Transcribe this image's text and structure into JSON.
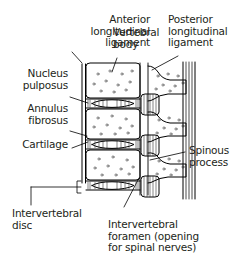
{
  "figure": {
    "background_color": "#ffffff",
    "ink_color": "#231f20",
    "line_color": "#000000"
  },
  "labels": {
    "anterior_longitudinal_ligament": "Anterior\nlongitudinal\nligament",
    "vertebral_body": "Vertebral\nbody",
    "posterior_longitudinal_ligament": "Posterior\nlongitudinal\nligament",
    "nucleus_pulposus": "Nucleus\npulposus",
    "annulus_fibrosus": "Annulus\nfibrosus",
    "cartilage": "Cartilage",
    "spinous_process": "Spinous\nprocess",
    "intervertebral_disc": "Intervertebral\ndisc",
    "intervertebral_foramen": "Intervertebral\nforamen (opening\nfor spinal nerves)"
  }
}
